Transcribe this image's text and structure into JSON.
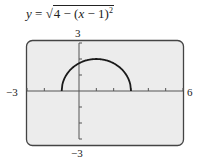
{
  "equation": {
    "lhs": "y",
    "equals": "=",
    "sqrt_symbol": "√",
    "radicand_a": "4 − (",
    "radicand_var": "x",
    "radicand_b": " − 1)",
    "exponent": "2"
  },
  "axis_labels": {
    "ymax": "3",
    "ymin": "−3",
    "xmin": "−3",
    "xmax": "6"
  },
  "colors": {
    "screen_bg": "#ececec",
    "screen_border": "#444444",
    "axis": "#555555",
    "curve": "#1a1a1a"
  },
  "chart_data": {
    "type": "line",
    "xlabel": "",
    "ylabel": "",
    "xlim": [
      -3,
      6
    ],
    "ylim": [
      -3,
      3
    ],
    "grid": false,
    "xticks": [
      -3,
      -2,
      -1,
      0,
      1,
      2,
      3,
      4,
      5,
      6
    ],
    "yticks": [
      -3,
      -2,
      -1,
      0,
      1,
      2,
      3
    ],
    "tick_labels": {
      "x": [
        "−3",
        "6"
      ],
      "y": [
        "−3",
        "3"
      ]
    },
    "series": [
      {
        "name": "y = sqrt(4 - (x - 1)^2)",
        "x": [
          -1,
          -0.75,
          -0.5,
          0,
          0.5,
          1,
          1.5,
          2,
          2.5,
          2.75,
          3
        ],
        "y": [
          0,
          0.968,
          1.323,
          1.732,
          1.936,
          2,
          1.936,
          1.732,
          1.323,
          0.968,
          0
        ]
      }
    ]
  }
}
